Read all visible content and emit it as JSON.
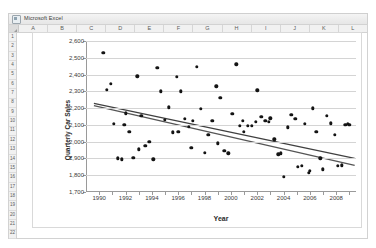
{
  "window": {
    "title": "Microsoft Excel",
    "icon": "excel-icon"
  },
  "spreadsheet": {
    "columns": [
      "A",
      "B",
      "C",
      "D",
      "E",
      "F",
      "G",
      "H",
      "I",
      "J",
      "K",
      "L"
    ],
    "rows": [
      "1",
      "2",
      "3",
      "4",
      "5",
      "6",
      "7",
      "8",
      "9",
      "10",
      "11",
      "12",
      "13",
      "14",
      "15",
      "16",
      "17",
      "18",
      "19",
      "20",
      "21",
      "22"
    ]
  },
  "chart_data": {
    "type": "scatter",
    "title": "",
    "xlabel": "Year",
    "ylabel": "Quarterly Car Sales",
    "xlim": [
      1989.0,
      2009.5
    ],
    "ylim": [
      1700,
      2600
    ],
    "xticks": [
      1990,
      1992,
      1994,
      1996,
      1998,
      2000,
      2002,
      2004,
      2006,
      2008
    ],
    "xticklabels": [
      "1990",
      "1992",
      "1994",
      "1996",
      "1998",
      "2000",
      "2002",
      "2004",
      "2006",
      "2008"
    ],
    "yticks": [
      1700,
      1800,
      1900,
      2000,
      2100,
      2200,
      2300,
      2400,
      2500,
      2600
    ],
    "yticklabels": [
      "1,700",
      "1,800",
      "1,900",
      "2,000",
      "2,100",
      "2,200",
      "2,300",
      "2,400",
      "2,500",
      "2,600"
    ],
    "grid": "horizontal",
    "legend": "none",
    "marker_color": "#141414",
    "gridline_color": "#d4d4d4",
    "axis_color": "#9a9a9a",
    "series": [
      {
        "name": "Quarterly Car Sales",
        "type": "scatter",
        "points": [
          [
            1990.3,
            2530
          ],
          [
            1990.6,
            2310
          ],
          [
            1990.9,
            2345
          ],
          [
            1991.1,
            2105
          ],
          [
            1991.4,
            1900
          ],
          [
            1991.7,
            1895
          ],
          [
            1992.0,
            2170
          ],
          [
            1992.3,
            2060
          ],
          [
            1992.6,
            1905
          ],
          [
            1992.9,
            2390
          ],
          [
            1993.2,
            2155
          ],
          [
            1993.5,
            1975
          ],
          [
            1993.8,
            2000
          ],
          [
            1994.1,
            1895
          ],
          [
            1994.4,
            2440
          ],
          [
            1994.7,
            2300
          ],
          [
            1995.0,
            2130
          ],
          [
            1995.3,
            2205
          ],
          [
            1995.6,
            2055
          ],
          [
            1995.9,
            2385
          ],
          [
            1996.2,
            2300
          ],
          [
            1996.5,
            2135
          ],
          [
            1996.8,
            2090
          ],
          [
            1997.1,
            2125
          ],
          [
            1997.4,
            2445
          ],
          [
            1997.7,
            2195
          ],
          [
            1998.0,
            1935
          ],
          [
            1998.3,
            2040
          ],
          [
            1998.6,
            2125
          ],
          [
            1998.9,
            2330
          ],
          [
            1999.2,
            2260
          ],
          [
            1999.5,
            1945
          ],
          [
            1999.8,
            1930
          ],
          [
            2000.1,
            2165
          ],
          [
            2000.4,
            2460
          ],
          [
            2000.7,
            2095
          ],
          [
            2001.0,
            2060
          ],
          [
            2001.3,
            2095
          ],
          [
            2001.6,
            2095
          ],
          [
            2002.0,
            2305
          ],
          [
            2002.3,
            2150
          ],
          [
            2002.6,
            2125
          ],
          [
            2003.0,
            2140
          ],
          [
            2003.3,
            2015
          ],
          [
            2003.6,
            1925
          ],
          [
            2003.8,
            1930
          ],
          [
            2004.0,
            1790
          ],
          [
            2004.3,
            2085
          ],
          [
            2004.6,
            2160
          ],
          [
            2004.9,
            2135
          ],
          [
            2005.1,
            1850
          ],
          [
            2005.4,
            1855
          ],
          [
            2005.6,
            2105
          ],
          [
            2005.9,
            1815
          ],
          [
            2006.2,
            2200
          ],
          [
            2006.5,
            2060
          ],
          [
            2006.8,
            1900
          ],
          [
            2007.0,
            1835
          ],
          [
            2007.3,
            2155
          ],
          [
            2007.6,
            2110
          ],
          [
            2007.9,
            2040
          ],
          [
            2008.1,
            1855
          ],
          [
            2008.4,
            1860
          ],
          [
            2008.7,
            2100
          ],
          [
            2009.0,
            2100
          ],
          [
            1991.9,
            2100
          ],
          [
            1993.0,
            1955
          ],
          [
            1996.0,
            2060
          ],
          [
            1997.0,
            1965
          ],
          [
            1999.0,
            1990
          ],
          [
            2000.9,
            2125
          ],
          [
            2001.9,
            2120
          ],
          [
            2002.9,
            2120
          ],
          [
            2006.0,
            1825
          ],
          [
            2008.9,
            2105
          ]
        ]
      },
      {
        "name": "trendline-linear",
        "type": "line",
        "color": "#404040",
        "endpoints": [
          [
            1989.6,
            2228
          ],
          [
            2009.4,
            1900
          ]
        ]
      },
      {
        "name": "trendline-curved",
        "type": "line",
        "color": "#555555",
        "endpoints": [
          [
            1989.6,
            2215
          ],
          [
            2009.4,
            1858
          ]
        ]
      }
    ]
  }
}
